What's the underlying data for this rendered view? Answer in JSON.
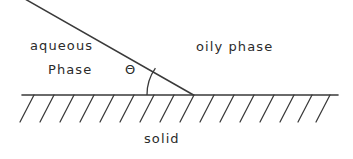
{
  "figure": {
    "background_color": "#ffffff",
    "stroke_color": "#3a3a3a",
    "text_color": "#2b2b2b"
  },
  "labels": {
    "aqueous": "aqueous",
    "phase": "Phase",
    "theta": "Θ",
    "oily_phase": "oily phase",
    "solid": "solid"
  },
  "geometry": {
    "baseline": {
      "x1": 22,
      "y1": 95,
      "x2": 338,
      "y2": 95
    },
    "interface_line": {
      "x1": 25,
      "y1": 0,
      "x2": 193,
      "y2": 95
    },
    "angle_arc": {
      "cx": 193,
      "cy": 95,
      "radius": 46,
      "start_x": 147,
      "start_y": 95,
      "end_x": 155.5,
      "end_y": 68
    },
    "hatching": {
      "count": 16,
      "spacing": 20,
      "first_x": 34,
      "length": 27,
      "dx": -14,
      "dy": 27
    }
  }
}
